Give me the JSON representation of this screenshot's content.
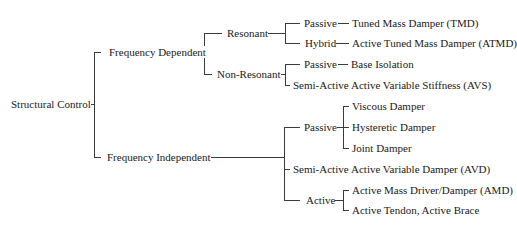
{
  "diagram": {
    "type": "tree",
    "orientation": "left-to-right",
    "root": {
      "label": "Structural Control",
      "children": [
        {
          "label": "Frequency Dependent",
          "children": [
            {
              "label": "Resonant",
              "children": [
                {
                  "label": "Passive",
                  "children": [
                    {
                      "label": "Tuned Mass Damper (TMD)"
                    }
                  ]
                },
                {
                  "label": "Hybrid",
                  "children": [
                    {
                      "label": "Active Tuned Mass Damper (ATMD)"
                    }
                  ]
                }
              ]
            },
            {
              "label": "Non-Resonant",
              "children": [
                {
                  "label": "Passive",
                  "children": [
                    {
                      "label": "Base Isolation"
                    }
                  ]
                },
                {
                  "label": "Semi-Active",
                  "children": [
                    {
                      "label": "Active Variable Stiffness (AVS)"
                    }
                  ]
                }
              ]
            }
          ]
        },
        {
          "label": "Frequency Independent",
          "children": [
            {
              "label": "Passive",
              "children": [
                {
                  "label": "Viscous Damper"
                },
                {
                  "label": "Hysteretic Damper"
                },
                {
                  "label": "Joint Damper"
                }
              ]
            },
            {
              "label": "Semi-Active",
              "children": [
                {
                  "label": "Active Variable Damper (AVD)"
                }
              ]
            },
            {
              "label": "Active",
              "children": [
                {
                  "label": "Active Mass Driver/Damper (AMD)"
                },
                {
                  "label": "Active Tendon, Active Brace"
                }
              ]
            }
          ]
        }
      ]
    },
    "line_color": "#3a3a3a",
    "text_color": "#1a1a1a",
    "background": "#ffffff"
  }
}
